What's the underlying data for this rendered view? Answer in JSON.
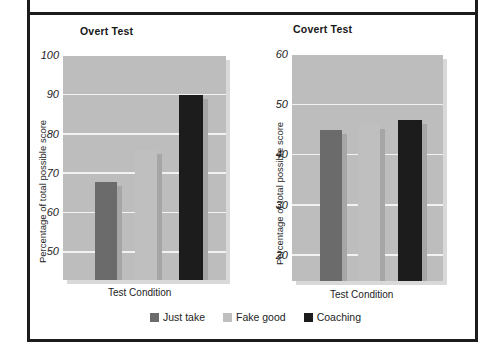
{
  "figure": {
    "legend": [
      {
        "label": "Just take",
        "color": "#6b6b6b"
      },
      {
        "label": "Fake good",
        "color": "#bfbfbf"
      },
      {
        "label": "Coaching",
        "color": "#1c1c1c"
      }
    ]
  },
  "chart_data": [
    {
      "type": "bar",
      "title": "Overt Test",
      "xlabel": "Test Condition",
      "ylabel": "Percentage of total possible score",
      "categories": [
        "Just take",
        "Fake good",
        "Coaching"
      ],
      "values": [
        68,
        76,
        90
      ],
      "colors": [
        "#6b6b6b",
        "#bfbfbf",
        "#1c1c1c"
      ],
      "ylim": [
        43,
        100
      ],
      "yticks": [
        50,
        60,
        70,
        80,
        90,
        100
      ],
      "ytick_labels": [
        "50",
        "60",
        "70",
        "80",
        "90",
        "100"
      ],
      "grid": true,
      "legend_position": "bottom"
    },
    {
      "type": "bar",
      "title": "Covert Test",
      "xlabel": "Test  Condition",
      "ylabel": "Percentage of total possible score",
      "categories": [
        "Just take",
        "Fake good",
        "Coaching"
      ],
      "values": [
        45,
        46,
        47
      ],
      "colors": [
        "#6b6b6b",
        "#bfbfbf",
        "#1c1c1c"
      ],
      "ylim": [
        15,
        60
      ],
      "yticks": [
        20,
        30,
        40,
        50,
        60
      ],
      "ytick_labels": [
        "20",
        "30",
        "40",
        "50",
        "60"
      ],
      "grid": true,
      "legend_position": "bottom"
    }
  ]
}
